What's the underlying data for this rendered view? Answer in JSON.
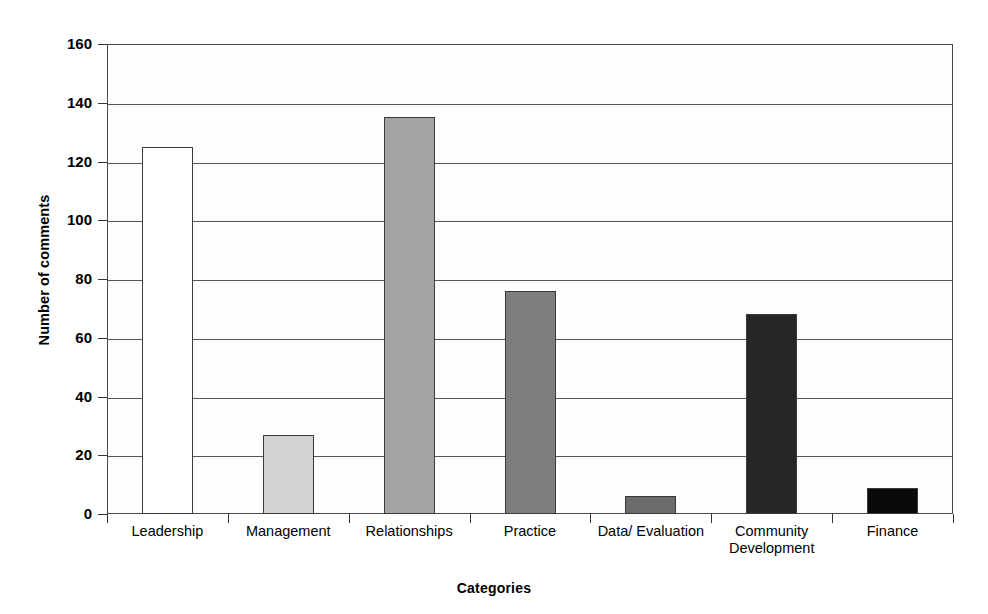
{
  "chart_data": {
    "type": "bar",
    "title": "",
    "xlabel": "Categories",
    "ylabel": "Number of comments",
    "categories": [
      "Leadership",
      "Management",
      "Relationships",
      "Practice",
      "Data/ Evaluation",
      "Community\nDevelopment",
      "Finance"
    ],
    "values": [
      125,
      27,
      135,
      76,
      6,
      68,
      9
    ],
    "ylim": [
      0,
      160
    ],
    "yticks": [
      0,
      20,
      40,
      60,
      80,
      100,
      120,
      140,
      160
    ],
    "ytick_labels": [
      "0",
      "20",
      "40",
      "60",
      "80",
      "100",
      "120",
      "140",
      "160"
    ],
    "grid": "horizontal",
    "legend": "none",
    "bar_colors": [
      "#ffffff",
      "#d2d2d2",
      "#a3a3a3",
      "#7e7e7e",
      "#6b6b6b",
      "#262626",
      "#0a0a0a"
    ],
    "bar_edge_color": "#3a3a3a",
    "axis_color": "#4a4a4a",
    "background": "#ffffff"
  }
}
